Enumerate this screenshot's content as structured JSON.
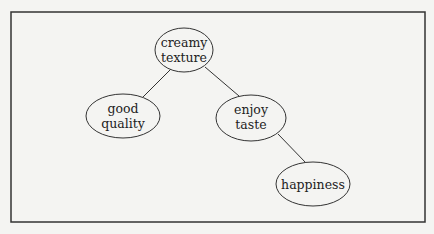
{
  "diagram": {
    "type": "concept-tree",
    "nodes": [
      {
        "id": "creamy_texture",
        "lines": [
          "creamy",
          "texture"
        ],
        "cx": 184,
        "cy": 50,
        "rx": 29,
        "ry": 22
      },
      {
        "id": "good_quality",
        "lines": [
          "good",
          "quality"
        ],
        "cx": 123,
        "cy": 116,
        "rx": 37,
        "ry": 22
      },
      {
        "id": "enjoy_taste",
        "lines": [
          "enjoy",
          "taste"
        ],
        "cx": 251,
        "cy": 118,
        "rx": 35,
        "ry": 23
      },
      {
        "id": "happiness",
        "lines": [
          "happiness"
        ],
        "cx": 313,
        "cy": 184,
        "rx": 37,
        "ry": 22
      }
    ],
    "edges": [
      {
        "from": "creamy_texture",
        "to": "good_quality"
      },
      {
        "from": "creamy_texture",
        "to": "enjoy_taste"
      },
      {
        "from": "enjoy_taste",
        "to": "happiness"
      }
    ],
    "colors": {
      "stroke": "#333333",
      "background": "#f4f4f2",
      "text": "#222222"
    }
  }
}
